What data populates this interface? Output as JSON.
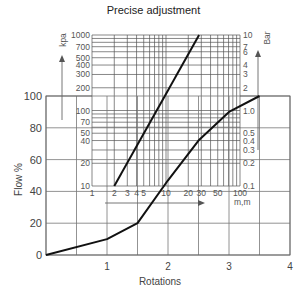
{
  "title": "Precise adjustment",
  "chart_data": [
    {
      "type": "line",
      "title": "Precise adjustment",
      "xlabel": "Rotations",
      "ylabel": "Flow %",
      "xlim": [
        0,
        4
      ],
      "ylim": [
        0,
        100
      ],
      "xticks": [
        1,
        2,
        3,
        4
      ],
      "yticks": [
        0,
        20,
        40,
        60,
        80,
        100
      ],
      "grid": true,
      "x_minor_step": 0.5,
      "series": [
        {
          "name": "Flow vs rotations",
          "x": [
            0,
            1,
            1.5,
            2,
            2.5,
            3,
            3.5
          ],
          "y": [
            0,
            10,
            20,
            47,
            72,
            90,
            100
          ]
        }
      ]
    },
    {
      "type": "line",
      "title": "Pressure drop nomogram (inset, log-log)",
      "xlabel": "m,m",
      "ylabel_left": "kpa",
      "ylabel_right": "Bar",
      "x_scale": "log",
      "y_scale": "log",
      "xlim": [
        1,
        100
      ],
      "ylim_left": [
        10,
        1000
      ],
      "ylim_right": [
        0.1,
        10
      ],
      "xticks": [
        "1",
        "2",
        "3",
        "4",
        "5",
        "10",
        "20",
        "30",
        "50",
        "100"
      ],
      "yticks_left": [
        "10",
        "20",
        "40",
        "50",
        "70",
        "100",
        "200",
        "300",
        "400",
        "500",
        "700",
        "1000"
      ],
      "yticks_right": [
        "0.1",
        "0.2",
        "0.3",
        "0.4",
        "0.5",
        "1.0",
        "2",
        "3",
        "4",
        "6",
        "7",
        "10"
      ],
      "series": [
        {
          "name": "Pressure line",
          "x": [
            2,
            28
          ],
          "y": [
            10,
            1000
          ]
        }
      ]
    }
  ]
}
